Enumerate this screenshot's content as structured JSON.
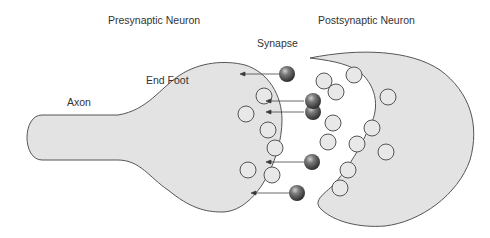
{
  "labels": {
    "presynaptic": "Presynaptic Neuron",
    "postsynaptic": "Postsynaptic Neuron",
    "synapse": "Synapse",
    "end_foot": "End Foot",
    "axon": "Axon"
  },
  "colors": {
    "cell_fill": "#e3e3e3",
    "cell_stroke": "#555555",
    "vesicle_fill": "#e8e8e8",
    "neurotransmitter": "#4a4a4a",
    "arrow": "#333333"
  },
  "legend_items": [
    {
      "name": "presynaptic-neuron",
      "label": "Presynaptic Neuron"
    },
    {
      "name": "postsynaptic-neuron",
      "label": "Postsynaptic Neuron"
    },
    {
      "name": "synapse",
      "label": "Synapse"
    },
    {
      "name": "end-foot",
      "label": "End Foot"
    },
    {
      "name": "axon",
      "label": "Axon"
    }
  ]
}
